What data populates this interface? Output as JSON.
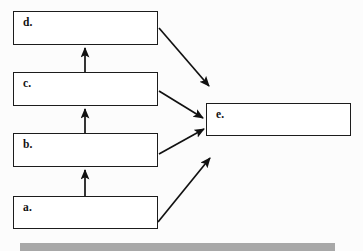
{
  "diagram": {
    "type": "flowchart",
    "background_color": "#fcfcfc",
    "box_fill_color": "#ffffff",
    "box_border_color": "#1c1c1c",
    "arrow_color": "#111111",
    "nodes": [
      {
        "id": "d",
        "label": "d.",
        "x": 13,
        "y": 11,
        "width": 145,
        "height": 34
      },
      {
        "id": "c",
        "label": "c.",
        "x": 13,
        "y": 72,
        "width": 145,
        "height": 34
      },
      {
        "id": "b",
        "label": "b.",
        "x": 13,
        "y": 133,
        "width": 145,
        "height": 34
      },
      {
        "id": "a",
        "label": "a.",
        "x": 13,
        "y": 196,
        "width": 145,
        "height": 33
      },
      {
        "id": "e",
        "label": "e.",
        "x": 206,
        "y": 103,
        "width": 145,
        "height": 33
      }
    ],
    "edges": [
      {
        "id": "a-to-b",
        "from": "a",
        "to": "b",
        "kind": "vertical-up",
        "x1": 85,
        "y1": 196,
        "x2": 85,
        "y2": 170
      },
      {
        "id": "b-to-c",
        "from": "b",
        "to": "c",
        "kind": "vertical-up",
        "x1": 85,
        "y1": 133,
        "x2": 85,
        "y2": 109
      },
      {
        "id": "c-to-d",
        "from": "c",
        "to": "d",
        "kind": "vertical-up",
        "x1": 85,
        "y1": 72,
        "x2": 85,
        "y2": 48
      },
      {
        "id": "d-to-e",
        "from": "d",
        "to": "e",
        "kind": "diagonal-down",
        "x1": 159,
        "y1": 28,
        "x2": 209,
        "y2": 86
      },
      {
        "id": "c-to-e",
        "from": "c",
        "to": "e",
        "kind": "diagonal-down",
        "x1": 159,
        "y1": 91,
        "x2": 203,
        "y2": 118
      },
      {
        "id": "b-to-e",
        "from": "b",
        "to": "e",
        "kind": "diagonal-up",
        "x1": 159,
        "y1": 154,
        "x2": 204,
        "y2": 129
      },
      {
        "id": "a-to-e",
        "from": "a",
        "to": "e",
        "kind": "diagonal-up",
        "x1": 158,
        "y1": 222,
        "x2": 210,
        "y2": 158
      }
    ],
    "footer": {
      "name": "footer-bar",
      "color": "#a8a8a8",
      "x": 20,
      "y": 243,
      "width": 315,
      "height": 8
    }
  }
}
